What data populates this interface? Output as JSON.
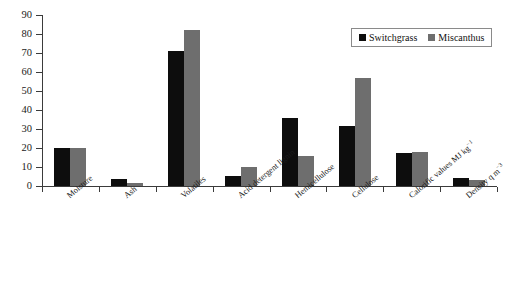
{
  "chart_data": {
    "type": "bar",
    "title": "",
    "xlabel": "",
    "ylabel": "",
    "ylim": [
      0,
      90
    ],
    "yticks": [
      0,
      10,
      20,
      30,
      40,
      50,
      60,
      70,
      80,
      90
    ],
    "grid": false,
    "legend_position": "top-right",
    "categories": [
      "Moisture",
      "Ash",
      "Volatiles",
      "Acid detergent lignin",
      "Hemicellulose",
      "Cellulose",
      "Calorific values MJ kg−1",
      "Density q m−3"
    ],
    "series": [
      {
        "name": "Switchgrass",
        "color": "#0d0d0d",
        "values": [
          20,
          3.5,
          71,
          5.5,
          36,
          31.5,
          17.5,
          4
        ]
      },
      {
        "name": "Miscanthus",
        "color": "#6e6e6e",
        "values": [
          19.8,
          1.8,
          82,
          10,
          16,
          57,
          18,
          3
        ]
      }
    ]
  },
  "legend": {
    "items": [
      {
        "label": "Switchgrass",
        "swatch": "black-square-swatch"
      },
      {
        "label": "Miscanthus",
        "swatch": "gray-square-swatch"
      }
    ]
  },
  "axis": {
    "y_tick_labels": [
      "0",
      "10",
      "20",
      "30",
      "40",
      "50",
      "60",
      "70",
      "80",
      "90"
    ]
  }
}
